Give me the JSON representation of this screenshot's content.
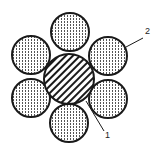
{
  "diagram": {
    "type": "cable-cross-section",
    "colors": {
      "stroke": "#1a1a1a",
      "background": "#ffffff",
      "dots": "#555555",
      "hatch": "#1a1a1a"
    },
    "core": {
      "cx": 69,
      "cy": 79,
      "r": 25,
      "fill": "diagonal-hatch",
      "label": "1"
    },
    "outer_strands": [
      {
        "name": "top",
        "cx": 70,
        "cy": 32,
        "r": 19
      },
      {
        "name": "upper-left",
        "cx": 31,
        "cy": 55,
        "r": 19
      },
      {
        "name": "upper-right",
        "cx": 108,
        "cy": 56,
        "r": 19
      },
      {
        "name": "lower-left",
        "cx": 31,
        "cy": 98,
        "r": 19
      },
      {
        "name": "lower-right",
        "cx": 108,
        "cy": 99,
        "r": 19
      },
      {
        "name": "bottom",
        "cx": 69,
        "cy": 123,
        "r": 19
      }
    ],
    "labels": [
      {
        "text": "1",
        "x": 105,
        "y": 138,
        "line": [
          86,
          101,
          104,
          131
        ]
      },
      {
        "text": "2",
        "x": 145,
        "y": 34,
        "line": [
          126,
          47,
          143,
          38
        ]
      }
    ]
  }
}
